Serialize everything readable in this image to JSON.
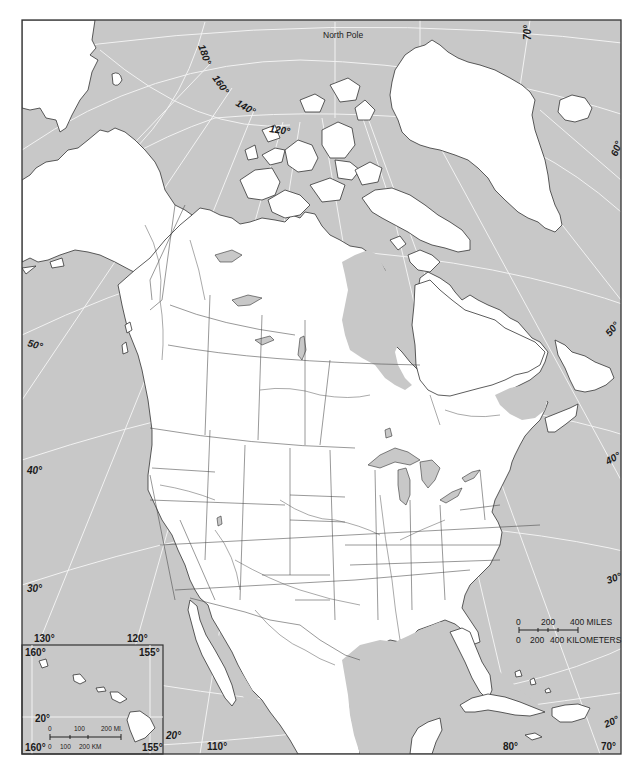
{
  "map": {
    "title_label": "North Pole",
    "colors": {
      "ocean": "#c8c8c8",
      "land": "#ffffff",
      "outline": "#333333",
      "graticule": "#f2f2f2"
    },
    "arctic_longitude_labels": [
      "180°",
      "160°",
      "140°",
      "120°"
    ],
    "top_right_longitude_label": "70°",
    "left_latitude_labels": [
      "50°",
      "40°",
      "30°"
    ],
    "right_latitude_labels": [
      "60°",
      "50°",
      "40°",
      "30°",
      "20°"
    ],
    "bottom_longitude_labels": [
      "110°",
      "80°",
      "70°"
    ],
    "left_bottom_longitude_labels": [
      "130°",
      "120°"
    ],
    "mexico_latitude_label": "20°"
  },
  "scale_bar": {
    "miles_ticks": [
      "0",
      "200",
      "400 MILES"
    ],
    "km_ticks": [
      "0",
      "200",
      "400 KILOMETERS"
    ]
  },
  "hawaii_inset": {
    "corner_labels": {
      "top_left": "160°",
      "top_right": "155°",
      "bottom_left": "160°",
      "bottom_right": "155°"
    },
    "latitude_label": "20°",
    "scale_miles": [
      "0",
      "100",
      "200 MI."
    ],
    "scale_km": [
      "0",
      "100",
      "200 KM"
    ]
  }
}
